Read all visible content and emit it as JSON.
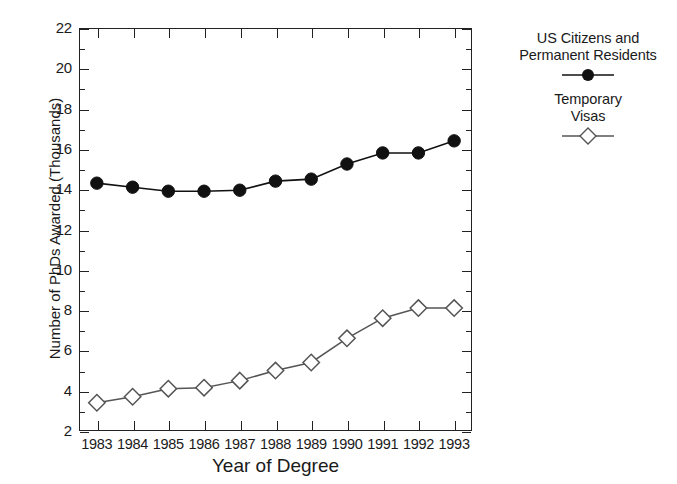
{
  "chart_data": {
    "type": "line",
    "title": "",
    "xlabel": "Year of Degree",
    "ylabel": "Number of PhDs Awarded (Thousands)",
    "x": [
      1983,
      1984,
      1985,
      1986,
      1987,
      1988,
      1989,
      1990,
      1991,
      1992,
      1993
    ],
    "categories": [
      "1983",
      "1984",
      "1985",
      "1986",
      "1987",
      "1988",
      "1989",
      "1990",
      "1991",
      "1992",
      "1993"
    ],
    "series": [
      {
        "name": "US Citizens and Permanent Residents",
        "marker": "filled-circle",
        "color": "#111111",
        "values": [
          14.3,
          14.1,
          13.9,
          13.9,
          13.95,
          14.4,
          14.5,
          15.25,
          15.8,
          15.8,
          16.4
        ]
      },
      {
        "name": "Temporary Visas",
        "marker": "open-diamond",
        "color": "#555555",
        "values": [
          3.4,
          3.7,
          4.1,
          4.15,
          4.5,
          5.0,
          5.4,
          6.6,
          7.6,
          8.1,
          8.1
        ]
      }
    ],
    "xlim": [
      1982.5,
      1993.5
    ],
    "ylim": [
      2,
      22
    ],
    "ytick_major": [
      2,
      4,
      6,
      8,
      10,
      12,
      14,
      16,
      18,
      20,
      22
    ],
    "ytick_major_labels": [
      "2",
      "4",
      "6",
      "8",
      "10",
      "12",
      "14",
      "16",
      "18",
      "20",
      "22"
    ],
    "ytick_minor": [
      3,
      5,
      7,
      9,
      11,
      13,
      15,
      17,
      19,
      21
    ],
    "grid": false,
    "legend_position": "right-top"
  },
  "legend": {
    "entries": [
      {
        "line1": "US Citizens and",
        "line2": "Permanent Residents",
        "marker": "filled-circle-marker"
      },
      {
        "line1": "Temporary",
        "line2": "Visas",
        "marker": "open-diamond-marker"
      }
    ]
  },
  "axes": {
    "x_title": "Year of Degree",
    "y_title": "Number of PhDs Awarded (Thousands)"
  },
  "colors": {
    "frame": "#222222",
    "series1": "#111111",
    "series2": "#555555",
    "background": "#ffffff"
  }
}
